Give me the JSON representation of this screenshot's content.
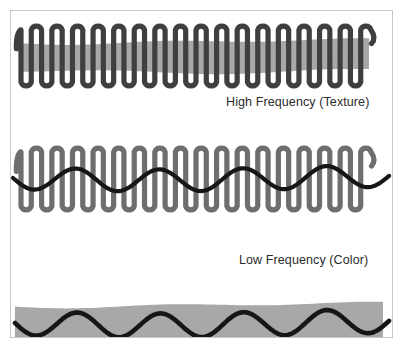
{
  "figure": {
    "title_alt": "Frequency decomposition illustration",
    "background_color": "#ffffff",
    "frame_border_color": "#c9c9c9",
    "canvas_color": "#ffffff"
  },
  "colors": {
    "band_gray": "#a3a3a3",
    "stroke_dark": "#3f3f3f",
    "stroke_black": "#161616",
    "stroke_gray": "#6e6e6e",
    "caption_text": "#2b2b2b"
  },
  "panels": [
    {
      "id": "high-frequency",
      "caption": "High Frequency (Texture)",
      "caption_visible": true,
      "band": {
        "name": "gray-band",
        "color": "#a3a3a3",
        "x_start": 8,
        "x_end": 358,
        "y_center": 45,
        "thickness": 29
      },
      "strokes": [
        {
          "name": "high-frequency-squiggle",
          "role": "high-frequency",
          "color": "#3f3f3f",
          "width": 5.2,
          "cycles": 17,
          "amplitude": 26,
          "y_center": 45,
          "x_start": 10,
          "x_end": 360,
          "shape": "square-squiggle"
        }
      ]
    },
    {
      "id": "combined",
      "caption": null,
      "caption_visible": false,
      "band": null,
      "strokes": [
        {
          "name": "high-frequency-squiggle",
          "role": "high-frequency",
          "color": "#6e6e6e",
          "width": 5.2,
          "cycles": 17,
          "amplitude": 27,
          "y_center": 48,
          "x_start": 10,
          "x_end": 360,
          "shape": "square-squiggle"
        },
        {
          "name": "low-frequency-wave",
          "role": "low-frequency",
          "color": "#161616",
          "width": 4.2,
          "cycles": 4.5,
          "amplitude": 11,
          "y_center": 48,
          "x_start": 2,
          "x_end": 378,
          "shape": "sine"
        }
      ]
    },
    {
      "id": "low-frequency",
      "caption": "Low Frequency (Color)",
      "caption_visible": true,
      "band": {
        "name": "gray-band",
        "color": "#a3a3a3",
        "x_start": 4,
        "x_end": 372,
        "y_center": 51,
        "thickness": 38
      },
      "strokes": [
        {
          "name": "low-frequency-wave",
          "role": "low-frequency",
          "color": "#161616",
          "width": 4.6,
          "cycles": 4.5,
          "amplitude": 12,
          "y_center": 51,
          "x_start": 4,
          "x_end": 378,
          "shape": "sine"
        }
      ]
    }
  ]
}
